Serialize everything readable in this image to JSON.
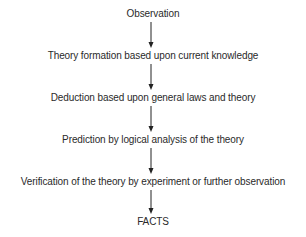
{
  "diagram": {
    "type": "flowchart",
    "direction": "top-to-bottom",
    "nodes": [
      {
        "id": "observation",
        "label": "Observation"
      },
      {
        "id": "theory-formation",
        "label": "Theory formation based upon current knowledge"
      },
      {
        "id": "deduction",
        "label": "Deduction based upon general laws and theory"
      },
      {
        "id": "prediction",
        "label": "Prediction by logical analysis of the theory"
      },
      {
        "id": "verification",
        "label": "Verification of the theory by experiment or further observation"
      },
      {
        "id": "facts",
        "label": "FACTS"
      }
    ],
    "edges": [
      {
        "from": "observation",
        "to": "theory-formation"
      },
      {
        "from": "theory-formation",
        "to": "deduction"
      },
      {
        "from": "deduction",
        "to": "prediction"
      },
      {
        "from": "prediction",
        "to": "verification"
      },
      {
        "from": "verification",
        "to": "facts"
      }
    ],
    "colors": {
      "text": "#2a2a2a",
      "arrow": "#222222",
      "background": "#ffffff"
    }
  }
}
